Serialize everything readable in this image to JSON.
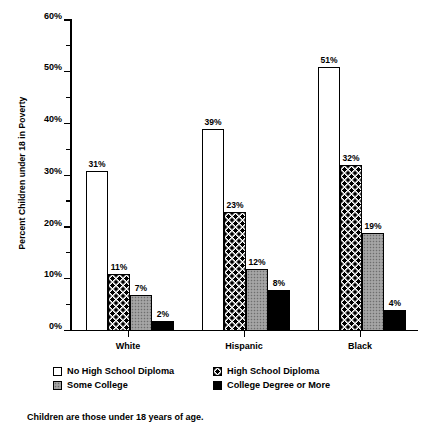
{
  "chart_data": {
    "type": "bar",
    "title": "",
    "xlabel": "",
    "ylabel": "Percent Children under 18 in Poverty",
    "ylim": [
      0,
      60
    ],
    "ytick_labels": [
      "0%",
      "10%",
      "20%",
      "30%",
      "40%",
      "50%",
      "60%"
    ],
    "ytick_values": [
      0,
      10,
      20,
      30,
      40,
      50,
      60
    ],
    "minor_tick_values": [
      5,
      15,
      25,
      35,
      45,
      55
    ],
    "grid": false,
    "legend_position": "below-axis",
    "value_suffix": "%",
    "categories": [
      "White",
      "Hispanic",
      "Black"
    ],
    "series": [
      {
        "name": "No High School Diploma",
        "fill": "none",
        "values": [
          31,
          39,
          51
        ],
        "labels": [
          "31%",
          "39%",
          "51%"
        ]
      },
      {
        "name": "High School Diploma",
        "fill": "dots",
        "values": [
          11,
          23,
          32
        ],
        "labels": [
          "11%",
          "23%",
          "32%"
        ]
      },
      {
        "name": "Some College",
        "fill": "gray",
        "values": [
          7,
          12,
          19
        ],
        "labels": [
          "7%",
          "12%",
          "19%"
        ]
      },
      {
        "name": "College Degree or More",
        "fill": "black",
        "values": [
          2,
          8,
          4
        ],
        "labels": [
          "2%",
          "8%",
          "4%"
        ]
      }
    ]
  },
  "legend": {
    "entries": [
      {
        "label": "No High School Diploma",
        "fill": "none"
      },
      {
        "label": "High School Diploma",
        "fill": "dots"
      },
      {
        "label": "Some College",
        "fill": "gray"
      },
      {
        "label": "College Degree or More",
        "fill": "black"
      }
    ]
  },
  "footnote": "Children are those under 18 years of age.",
  "colors": {
    "axis": "#000000",
    "text": "#000000",
    "background": "#ffffff",
    "bar_none": "#ffffff",
    "bar_gray": "#9a9a9a",
    "bar_black": "#000000"
  }
}
